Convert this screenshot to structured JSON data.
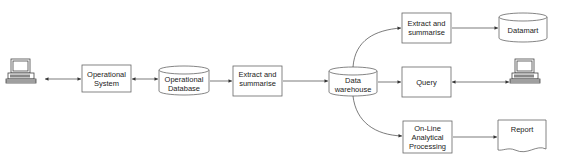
{
  "diagram": {
    "nodes": {
      "user_left": {
        "icon": "computer-terminal-icon"
      },
      "operational_system": {
        "label": "Operational\nSystem",
        "shape": "box"
      },
      "operational_database": {
        "label": "Operational\nDatabase",
        "shape": "cylinder"
      },
      "extract_summarise_1": {
        "label": "Extract and\nsummarise",
        "shape": "box"
      },
      "data_warehouse": {
        "label": "Data\nwarehouse",
        "shape": "cylinder"
      },
      "extract_summarise_2": {
        "label": "Extract and\nsummarise",
        "shape": "box"
      },
      "datamart": {
        "label": "Datamart",
        "shape": "cylinder"
      },
      "query": {
        "label": "Query",
        "shape": "box"
      },
      "user_right": {
        "icon": "computer-terminal-icon"
      },
      "olap": {
        "label": "On-Line\nAnalytical\nProcessing",
        "shape": "box"
      },
      "report": {
        "label": "Report",
        "shape": "document"
      }
    },
    "edges": [
      {
        "from": "user_left",
        "to": "operational_system",
        "direction": "both"
      },
      {
        "from": "operational_system",
        "to": "operational_database",
        "direction": "both"
      },
      {
        "from": "operational_database",
        "to": "extract_summarise_1",
        "direction": "forward"
      },
      {
        "from": "extract_summarise_1",
        "to": "data_warehouse",
        "direction": "forward"
      },
      {
        "from": "data_warehouse",
        "to": "extract_summarise_2",
        "direction": "forward"
      },
      {
        "from": "data_warehouse",
        "to": "query",
        "direction": "forward"
      },
      {
        "from": "data_warehouse",
        "to": "olap",
        "direction": "forward"
      },
      {
        "from": "extract_summarise_2",
        "to": "datamart",
        "direction": "forward"
      },
      {
        "from": "query",
        "to": "user_right",
        "direction": "both"
      },
      {
        "from": "olap",
        "to": "report",
        "direction": "forward"
      }
    ],
    "colors": {
      "stroke": "#555555",
      "fill": "#ffffff",
      "text": "#222222"
    }
  }
}
